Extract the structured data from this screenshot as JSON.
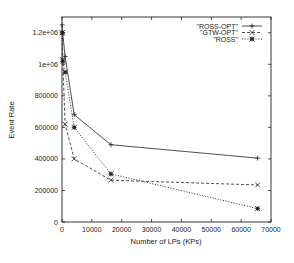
{
  "chart_data": {
    "type": "line",
    "title": "",
    "xlabel": "Number of LPs (KPs)",
    "ylabel": "Event Rate",
    "xlim": [
      0,
      70000
    ],
    "ylim": [
      0,
      1300000
    ],
    "xticks": [
      0,
      10000,
      20000,
      30000,
      40000,
      50000,
      60000,
      70000
    ],
    "xtick_labels": [
      "0",
      "10000",
      "20000",
      "30000",
      "40000",
      "50000",
      "60000",
      "70000"
    ],
    "yticks": [
      0,
      200000,
      400000,
      600000,
      800000,
      1000000,
      1200000
    ],
    "ytick_labels": [
      "0",
      "200000",
      "400000",
      "600000",
      "800000",
      "1e+06",
      "1.2e+06"
    ],
    "grid": false,
    "legend_position": "top-right",
    "series": [
      {
        "name": "\"ROSS-OPT\"",
        "style": "solid",
        "marker": "plus",
        "x": [
          64,
          256,
          1024,
          4096,
          16384,
          65536
        ],
        "values": [
          1250000,
          1200000,
          1050000,
          680000,
          490000,
          405000
        ]
      },
      {
        "name": "\"GTW-OPT\"",
        "style": "dashed",
        "marker": "cross",
        "x": [
          64,
          256,
          1024,
          4096,
          16384,
          65536
        ],
        "values": [
          1200000,
          1030000,
          620000,
          400000,
          265000,
          235000
        ]
      },
      {
        "name": "\"ROSS\"",
        "style": "dotted",
        "marker": "star",
        "x": [
          64,
          256,
          1024,
          4096,
          16384,
          65536
        ],
        "values": [
          1200000,
          1020000,
          950000,
          600000,
          305000,
          85000
        ]
      }
    ]
  }
}
